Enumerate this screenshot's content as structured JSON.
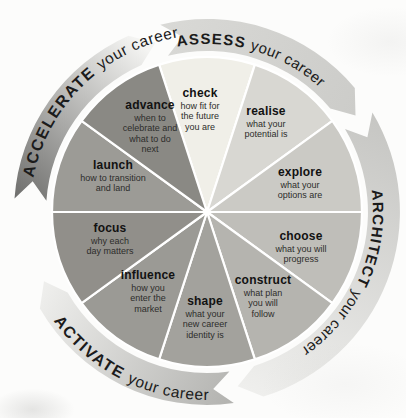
{
  "diagram": {
    "ink_color": "#1b1b1b",
    "divider_color": "#ffffff",
    "phases": [
      {
        "id": "assess",
        "label": "ASSESS",
        "suffix": "your career",
        "color_tail": "#d9d9d6",
        "color_head": "#ccccc9"
      },
      {
        "id": "architect",
        "label": "ARCHITECT",
        "suffix": "your career",
        "color_tail": "#c6c6c3",
        "color_head": "#efefed"
      },
      {
        "id": "activate",
        "label": "ACTIVATE",
        "suffix": "your career",
        "color_tail": "#b2b2af",
        "color_head": "#eeeeec"
      },
      {
        "id": "accelerate",
        "label": "ACCELERATE",
        "suffix": "your career",
        "color_tail": "#6e6e6c",
        "color_head": "#f4f4f2"
      }
    ],
    "segments": [
      {
        "title": "check",
        "desc": "how fit for\nthe future\nyou are",
        "color": "#f0efe8"
      },
      {
        "title": "realise",
        "desc": "what your\npotential is",
        "color": "#d8d7d2"
      },
      {
        "title": "explore",
        "desc": "what your\noptions are",
        "color": "#cbcac5"
      },
      {
        "title": "choose",
        "desc": "what you will\nprogress",
        "color": "#bfbeb9"
      },
      {
        "title": "construct",
        "desc": "what plan\nyou will\nfollow",
        "color": "#b5b4af"
      },
      {
        "title": "shape",
        "desc": "what your\nnew career\nidentity is",
        "color": "#a3a29d"
      },
      {
        "title": "influence",
        "desc": "how you\nenter the\nmarket",
        "color": "#9b9a95"
      },
      {
        "title": "focus",
        "desc": "why each\nday matters",
        "color": "#918f8a"
      },
      {
        "title": "launch",
        "desc": "how to transition\nand land",
        "color": "#9c9b96"
      },
      {
        "title": "advance",
        "desc": "when to\ncelebrate and\nwhat to do\nnext",
        "color": "#8a8984"
      }
    ]
  }
}
